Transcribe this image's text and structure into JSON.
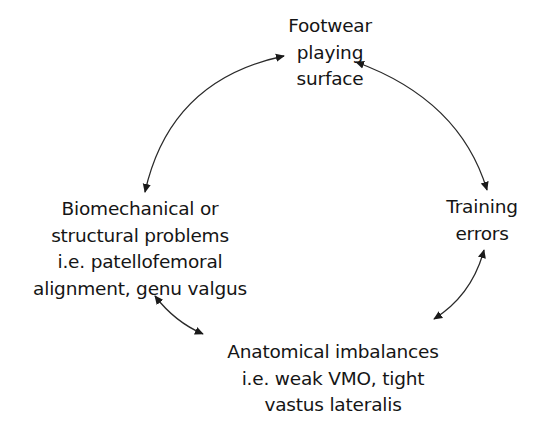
{
  "diagram": {
    "type": "cycle",
    "colors": {
      "background": "#ffffff",
      "text": "#151515",
      "arrow": "#222222"
    },
    "nodes": [
      {
        "id": "footwear",
        "position": "top",
        "lines": [
          "Footwear",
          "playing",
          "surface"
        ]
      },
      {
        "id": "training",
        "position": "right",
        "lines": [
          "Training",
          "errors"
        ]
      },
      {
        "id": "anatomical",
        "position": "bottom",
        "lines": [
          "Anatomical imbalances",
          "i.e. weak VMO, tight",
          "vastus lateralis"
        ]
      },
      {
        "id": "biomechanical",
        "position": "left",
        "lines": [
          "Biomechanical or",
          "structural problems",
          "i.e. patellofemoral",
          "alignment, genu valgus"
        ]
      }
    ],
    "edges": [
      {
        "from": "biomechanical",
        "to": "footwear",
        "direction": "bidirectional"
      },
      {
        "from": "footwear",
        "to": "training",
        "direction": "bidirectional"
      },
      {
        "from": "training",
        "to": "anatomical",
        "direction": "bidirectional"
      },
      {
        "from": "anatomical",
        "to": "biomechanical",
        "direction": "bidirectional"
      }
    ]
  }
}
